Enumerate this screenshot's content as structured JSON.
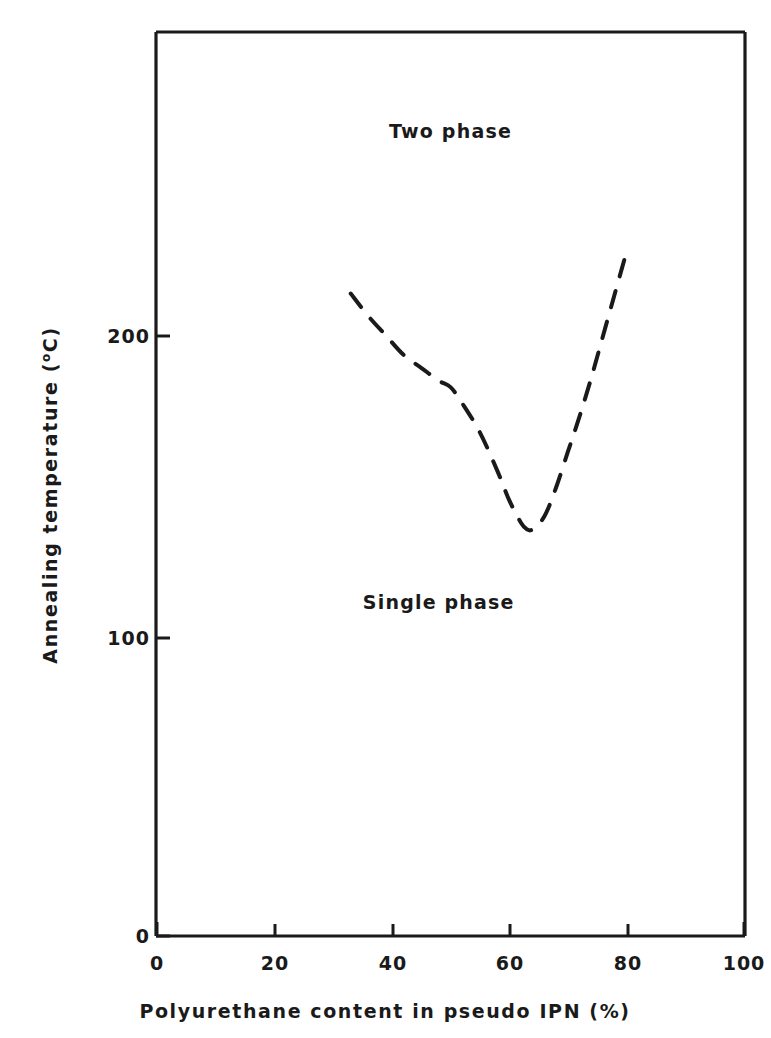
{
  "chart_data": {
    "type": "line",
    "title": "",
    "xlabel": "Polyurethane content in pseudo IPN (%)",
    "ylabel": "Annealing temperature (°C)",
    "xlim": [
      0,
      100
    ],
    "ylim": [
      0,
      280
    ],
    "xticks": [
      0,
      20,
      40,
      60,
      80,
      100
    ],
    "xtick_labels": [
      "0",
      "20",
      "40",
      "60",
      "80",
      "100"
    ],
    "yticks": [
      0,
      100,
      200
    ],
    "ytick_labels": [
      "0",
      "100",
      "200"
    ],
    "grid": false,
    "legend": null,
    "frame": "box",
    "series": [
      {
        "name": "Phase boundary",
        "style": "dashed",
        "color": "#1a1a1a",
        "x": [
          33,
          36,
          39,
          42,
          45,
          48,
          50,
          52,
          55,
          58,
          60,
          62,
          63,
          64,
          66,
          68,
          70,
          72,
          74,
          76,
          78,
          80
        ],
        "y": [
          199,
          192,
          186,
          180,
          176,
          172,
          170,
          165,
          156,
          144,
          135,
          128,
          126,
          126,
          130,
          139,
          150,
          161,
          173,
          186,
          199,
          212
        ]
      }
    ],
    "annotations": [
      {
        "text": "Two phase",
        "x": 50,
        "y": 249
      },
      {
        "text": "Single phase",
        "x": 48,
        "y": 103
      }
    ]
  },
  "axes": {
    "x_title": "Polyurethane content in pseudo IPN (%)",
    "y_title_main": "Annealing temperature (",
    "y_title_sup": "o",
    "y_title_tail": "C)",
    "xtick_0": "0",
    "xtick_1": "20",
    "xtick_2": "40",
    "xtick_3": "60",
    "xtick_4": "80",
    "xtick_5": "100",
    "ytick_0": "0",
    "ytick_1": "100",
    "ytick_2": "200"
  },
  "regions": {
    "two_phase": "Two phase",
    "single_phase": "Single phase"
  },
  "colors": {
    "ink": "#1a1a1a",
    "background": "#ffffff"
  }
}
